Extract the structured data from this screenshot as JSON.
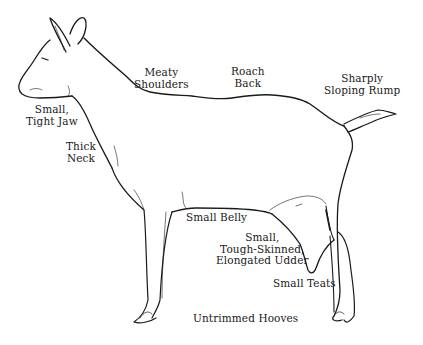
{
  "diagram": {
    "colors": {
      "line": "#1a1a1a",
      "background": "#ffffff",
      "text": "#1a1a1a"
    },
    "labels": [
      {
        "id": "meaty-shoulders",
        "lines": [
          "Meaty",
          "Shoulders"
        ]
      },
      {
        "id": "roach-back",
        "lines": [
          "Roach",
          "Back"
        ]
      },
      {
        "id": "sharply-sloping-rump",
        "lines": [
          "Sharply",
          "Sloping Rump"
        ]
      },
      {
        "id": "small-tight-jaw",
        "lines": [
          "Small,",
          "Tight Jaw"
        ]
      },
      {
        "id": "thick-neck",
        "lines": [
          "Thick",
          "Neck"
        ]
      },
      {
        "id": "small-belly",
        "lines": [
          "Small Belly"
        ]
      },
      {
        "id": "small-tough-skinned-elongated-udder",
        "lines": [
          "Small,",
          "Tough-Skinned,",
          "Elongated Udder"
        ]
      },
      {
        "id": "small-teats",
        "lines": [
          "Small Teats"
        ]
      },
      {
        "id": "untrimmed-hooves",
        "lines": [
          "Untrimmed Hooves"
        ]
      }
    ]
  }
}
